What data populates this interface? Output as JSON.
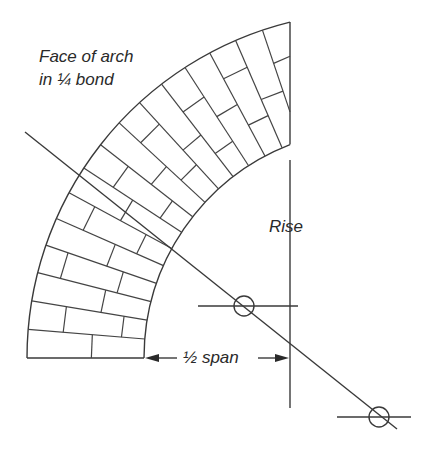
{
  "labels": {
    "title_line1": "Face of arch",
    "title_line2": "in ¼ bond",
    "rise": "Rise",
    "half_span": "½ span"
  },
  "geometry": {
    "center": [
      373,
      358
    ],
    "outer_radius": 346,
    "inner_radius": 229,
    "start_angle_deg": 180,
    "end_x": 290,
    "courses": 16,
    "diagonal": [
      [
        25,
        132
      ],
      [
        397,
        429
      ]
    ],
    "rise_line": {
      "x": 290,
      "y1": 160,
      "y2": 408
    },
    "circle_1": {
      "cx": 244,
      "cy": 306,
      "r": 10,
      "hline": [
        198,
        298
      ]
    },
    "circle_2": {
      "cx": 379,
      "cy": 417,
      "r": 10,
      "hline": [
        337,
        411
      ]
    },
    "span_arrow": {
      "y": 358,
      "x1": 145,
      "x2": 289,
      "text_x": 183
    }
  },
  "bond_pattern": [
    [
      0.55
    ],
    [
      0.3,
      0.8
    ],
    [
      0.6
    ],
    [
      0.2,
      0.7
    ],
    [
      0.55
    ],
    [
      0.25,
      0.75
    ],
    [
      0.5
    ],
    [
      0.3,
      0.78
    ],
    [
      0.55
    ],
    [
      0.25,
      0.72
    ],
    [
      0.55
    ],
    [
      0.3,
      0.75
    ],
    [
      0.5
    ],
    [
      0.25,
      0.7
    ],
    [
      0.55
    ],
    [
      0.3
    ]
  ],
  "colors": {
    "line": "#3a3a3a",
    "text": "#2a2a2a",
    "background": "#ffffff"
  }
}
